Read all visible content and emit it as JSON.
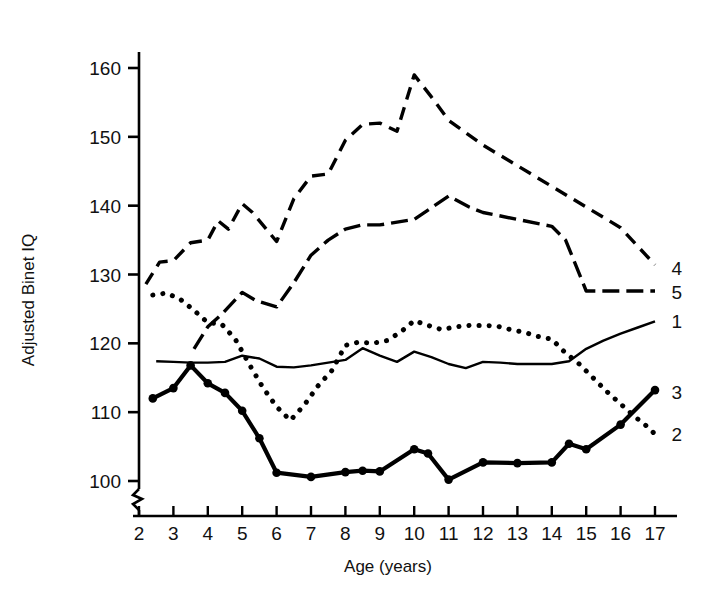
{
  "chart_data": {
    "type": "line",
    "title": "",
    "xlabel": "Age (years)",
    "ylabel": "Adjusted Binet IQ",
    "xlim": [
      2,
      17
    ],
    "ylim": [
      100,
      160
    ],
    "y_axis_break": true,
    "grid": false,
    "legend_position": "right-inline-labels",
    "xticks": [
      "2",
      "3",
      "4",
      "5",
      "6",
      "7",
      "8",
      "9",
      "10",
      "11",
      "12",
      "13",
      "14",
      "15",
      "16",
      "17"
    ],
    "yticks": [
      "100",
      "110",
      "120",
      "130",
      "140",
      "150",
      "160"
    ],
    "series": [
      {
        "name": "1",
        "label": "1",
        "style": "thin-solid",
        "marker": "none",
        "x": [
          2.5,
          3.0,
          3.5,
          4.0,
          4.5,
          5.0,
          5.5,
          6.0,
          6.5,
          7.0,
          7.5,
          8.0,
          8.5,
          9.0,
          9.5,
          10.0,
          10.5,
          11.0,
          11.5,
          12.0,
          12.5,
          13.0,
          13.5,
          14.0,
          14.5,
          15.0,
          15.5,
          16.0,
          16.5,
          17.0
        ],
        "values": [
          117.4,
          117.3,
          117.2,
          117.2,
          117.3,
          118.2,
          117.8,
          116.6,
          116.5,
          116.8,
          117.2,
          117.6,
          119.3,
          118.2,
          117.3,
          118.8,
          118.0,
          117.0,
          116.4,
          117.3,
          117.2,
          117.0,
          117.0,
          117.0,
          117.4,
          119.2,
          120.4,
          121.4,
          122.3,
          123.2
        ]
      },
      {
        "name": "2",
        "label": "2",
        "style": "dotted",
        "marker": "none",
        "x": [
          2.4,
          2.8,
          3.2,
          3.6,
          4.0,
          4.4,
          4.8,
          5.2,
          5.6,
          6.0,
          6.4,
          6.8,
          7.2,
          7.6,
          8.0,
          8.4,
          8.8,
          9.2,
          9.6,
          10.0,
          10.4,
          10.8,
          11.2,
          11.6,
          12.0,
          12.4,
          12.8,
          13.2,
          13.6,
          14.0,
          14.4,
          14.8,
          15.2,
          15.6,
          16.0,
          16.4,
          16.8,
          17.0
        ],
        "values": [
          127.0,
          127.3,
          126.4,
          124.8,
          123.0,
          122.8,
          120.6,
          117.0,
          113.6,
          110.8,
          108.8,
          111.0,
          113.8,
          116.0,
          119.7,
          120.2,
          120.0,
          120.4,
          121.6,
          123.3,
          122.6,
          122.0,
          122.4,
          122.6,
          122.6,
          122.5,
          122.0,
          121.6,
          121.0,
          120.6,
          118.6,
          117.0,
          115.0,
          113.0,
          111.2,
          109.4,
          107.8,
          106.8
        ]
      },
      {
        "name": "3",
        "label": "3",
        "style": "thick-solid",
        "marker": "filled-circle",
        "x": [
          2.4,
          3.0,
          3.5,
          4.0,
          4.5,
          5.0,
          5.5,
          6.0,
          7.0,
          8.0,
          8.5,
          9.0,
          10.0,
          10.4,
          11.0,
          12.0,
          13.0,
          14.0,
          14.5,
          15.0,
          16.0,
          17.0
        ],
        "values": [
          112.0,
          113.5,
          116.8,
          114.2,
          112.8,
          110.2,
          106.2,
          101.2,
          100.6,
          101.3,
          101.5,
          101.4,
          104.6,
          104.0,
          100.2,
          102.7,
          102.6,
          102.7,
          105.4,
          104.6,
          108.2,
          113.2
        ]
      },
      {
        "name": "4",
        "label": "4",
        "style": "dashed",
        "marker": "none",
        "x": [
          2.2,
          2.6,
          3.0,
          3.5,
          4.0,
          4.3,
          4.6,
          5.0,
          5.3,
          5.7,
          6.0,
          6.5,
          7.0,
          7.5,
          8.0,
          8.5,
          9.0,
          9.5,
          10.0,
          10.5,
          11.0,
          12.0,
          13.0,
          14.0,
          15.0,
          16.0,
          17.0
        ],
        "values": [
          128.6,
          131.8,
          132.0,
          134.6,
          135.0,
          137.8,
          136.6,
          140.3,
          139.0,
          136.6,
          134.8,
          141.0,
          144.3,
          144.6,
          149.5,
          151.8,
          152.0,
          150.8,
          159.0,
          155.8,
          152.4,
          148.8,
          145.8,
          142.8,
          139.8,
          136.8,
          131.4
        ]
      },
      {
        "name": "5",
        "label": "5",
        "style": "dash-dot",
        "marker": "none",
        "x": [
          3.6,
          4.0,
          4.4,
          5.0,
          5.4,
          6.0,
          6.5,
          7.0,
          7.5,
          8.0,
          8.5,
          9.0,
          10.0,
          11.0,
          11.6,
          12.0,
          13.0,
          14.0,
          14.4,
          15.0,
          16.0,
          17.0
        ],
        "values": [
          119.2,
          122.4,
          124.2,
          127.4,
          126.2,
          125.3,
          128.8,
          132.8,
          135.0,
          136.6,
          137.2,
          137.2,
          138.0,
          141.4,
          139.8,
          139.0,
          138.0,
          137.0,
          135.0,
          127.6,
          127.6,
          127.6
        ]
      }
    ],
    "series_label_positions": [
      {
        "label": "4",
        "x": 17.25,
        "y": 131.0
      },
      {
        "label": "5",
        "x": 17.25,
        "y": 127.4
      },
      {
        "label": "1",
        "x": 17.25,
        "y": 123.2
      },
      {
        "label": "3",
        "x": 17.25,
        "y": 113.0
      },
      {
        "label": "2",
        "x": 17.25,
        "y": 106.8
      }
    ]
  }
}
